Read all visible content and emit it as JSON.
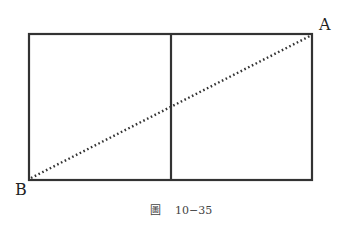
{
  "figure": {
    "caption_prefix": "圖",
    "caption_number": "10−35",
    "points": {
      "A": "A",
      "B": "B"
    },
    "colors": {
      "stroke": "#333333",
      "dotted": "#333333",
      "background": "#ffffff"
    },
    "shapes": {
      "outer_rectangle": {
        "x1": 29,
        "y1": 34,
        "x2": 312,
        "y2": 180
      },
      "divider": {
        "x": 171,
        "y1": 34,
        "y2": 180
      },
      "diagonal": {
        "from": "B",
        "to": "A",
        "style": "dotted"
      }
    }
  }
}
